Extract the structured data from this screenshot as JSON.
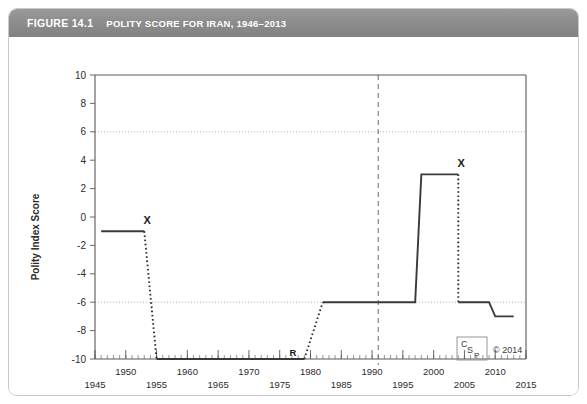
{
  "figure": {
    "number": "FIGURE 14.1",
    "title": "POLITY SCORE FOR IRAN, 1946–2013"
  },
  "credit": {
    "logo_c": "C",
    "logo_s": "S",
    "logo_p": "P",
    "copyright": "© 2014"
  },
  "chart_data": {
    "type": "line",
    "title": "POLITY SCORE FOR IRAN, 1946–2013",
    "xlabel": "",
    "ylabel": "Polity Index Score",
    "xlim": [
      1945,
      2015
    ],
    "ylim": [
      -10,
      10
    ],
    "ytick_values": [
      10,
      8,
      6,
      4,
      2,
      0,
      -2,
      -4,
      -6,
      -8,
      -10
    ],
    "ytick_labels": [
      "10",
      "8",
      "6",
      "4",
      "2",
      "0",
      "-2",
      "-4",
      "-6",
      "-8",
      "-10"
    ],
    "xtick_values": [
      1945,
      1950,
      1955,
      1960,
      1965,
      1970,
      1975,
      1980,
      1985,
      1990,
      1995,
      2000,
      2005,
      2010,
      2015
    ],
    "xtick_labels": [
      "1945",
      "1950",
      "1955",
      "1960",
      "1965",
      "1970",
      "1975",
      "1980",
      "1985",
      "1990",
      "1995",
      "2000",
      "2005",
      "2010",
      "2015"
    ],
    "xtick_rows": [
      "bottom",
      "top",
      "bottom",
      "top",
      "bottom",
      "top",
      "bottom",
      "top",
      "bottom",
      "top",
      "bottom",
      "top",
      "bottom",
      "top",
      "bottom"
    ],
    "minor_tick_interval": 1,
    "grid": "horizontal dotted at +6 and -6 only",
    "gridlines_y": [
      6,
      -6
    ],
    "reference_line_x": 1991,
    "reference_line_style": "dashed vertical",
    "series": [
      {
        "name": "Polity Index Score",
        "segments": [
          {
            "style": "solid",
            "points": [
              [
                1946,
                -1
              ],
              [
                1953,
                -1
              ]
            ]
          },
          {
            "style": "dotted",
            "points": [
              [
                1953,
                -1
              ],
              [
                1955,
                -10
              ]
            ]
          },
          {
            "style": "solid",
            "points": [
              [
                1955,
                -10
              ],
              [
                1979,
                -10
              ]
            ]
          },
          {
            "style": "dotted",
            "points": [
              [
                1979,
                -10
              ],
              [
                1982,
                -6
              ]
            ]
          },
          {
            "style": "solid",
            "points": [
              [
                1982,
                -6
              ],
              [
                1997,
                -6
              ],
              [
                1998,
                3
              ],
              [
                2004,
                3
              ]
            ]
          },
          {
            "style": "dotted",
            "points": [
              [
                2004,
                3
              ],
              [
                2004,
                -6
              ]
            ]
          },
          {
            "style": "solid",
            "points": [
              [
                2004,
                -6
              ],
              [
                2009,
                -6
              ],
              [
                2010,
                -7
              ],
              [
                2013,
                -7
              ]
            ]
          }
        ]
      }
    ],
    "annotations": [
      {
        "label": "X",
        "x": 1953,
        "y": -1,
        "note": "1953 coup"
      },
      {
        "label": "R",
        "x": 1979,
        "y": -10,
        "note": "1979 revolution"
      },
      {
        "label": "X",
        "x": 2004,
        "y": 3,
        "note": "2004 regime change"
      }
    ]
  }
}
